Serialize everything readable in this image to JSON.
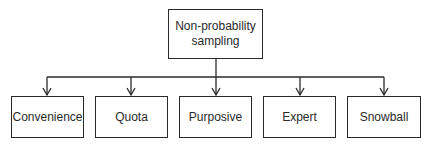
{
  "diagram": {
    "root": {
      "label_line1": "Non-probability",
      "label_line2": "sampling"
    },
    "children": [
      {
        "label": "Convenience"
      },
      {
        "label": "Quota"
      },
      {
        "label": "Purposive"
      },
      {
        "label": "Expert"
      },
      {
        "label": "Snowball"
      }
    ],
    "colors": {
      "stroke": "#2a2a2a",
      "background": "#ffffff",
      "text": "#2a2a2a"
    }
  }
}
